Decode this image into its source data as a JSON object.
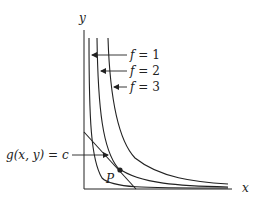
{
  "diagram": {
    "axes": {
      "x_label": "x",
      "y_label": "y"
    },
    "level_curves": [
      {
        "label_var": "f",
        "label_eq": " = ",
        "label_val": "1"
      },
      {
        "label_var": "f",
        "label_eq": " = ",
        "label_val": "2"
      },
      {
        "label_var": "f",
        "label_eq": " = ",
        "label_val": "3"
      }
    ],
    "constraint": {
      "label": "g(x, y) = c"
    },
    "point": {
      "label": "P"
    },
    "colors": {
      "ink": "#222222",
      "background": "#ffffff"
    }
  }
}
